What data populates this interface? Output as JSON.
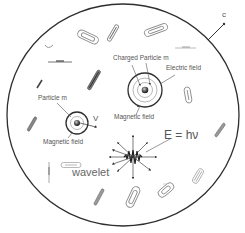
{
  "diagram": {
    "boundary_label": "c",
    "charged_particle": {
      "label": "Charged Particle m",
      "electric_field_label": "Electric field",
      "magnetic_field_label": "Magnetic field"
    },
    "moving_particle": {
      "label": "Particle m",
      "velocity_label": "V",
      "magnetic_field_label": "Magnetic field"
    },
    "photon": {
      "equation": "E = hν",
      "wavelet_label": "wavelet"
    },
    "colors": {
      "line": "#2e2e2e",
      "text": "#555555",
      "background": "#ffffff"
    }
  }
}
